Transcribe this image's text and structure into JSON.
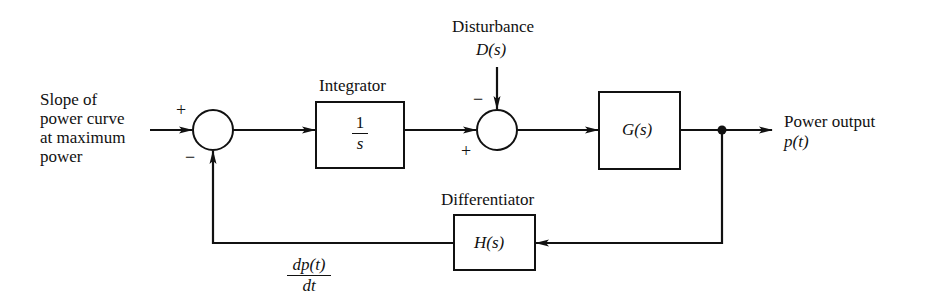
{
  "diagram": {
    "type": "block-diagram",
    "input_label": [
      "Slope of",
      "power curve",
      "at maximum",
      "power"
    ],
    "summing_junction_1": {
      "plus_sign": "+",
      "minus_sign": "−"
    },
    "integrator": {
      "label": "Integrator",
      "numerator": "1",
      "denominator": "s"
    },
    "disturbance": {
      "label": "Disturbance",
      "symbol": "D(s)"
    },
    "summing_junction_2": {
      "plus_sign": "+",
      "minus_sign": "−"
    },
    "plant": {
      "symbol": "G(s)"
    },
    "output": {
      "label": "Power output",
      "symbol": "p(t)"
    },
    "differentiator": {
      "label": "Differentiator",
      "symbol": "H(s)"
    },
    "feedback_signal": {
      "numerator": "dp(t)",
      "denominator": "dt"
    },
    "colors": {
      "line": "#111111",
      "background": "#ffffff"
    }
  }
}
